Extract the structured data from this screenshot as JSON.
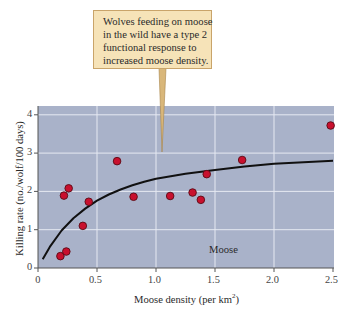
{
  "callout": {
    "lines": [
      "Wolves feeding on moose",
      "in the wild have a type 2",
      "functional response to",
      "increased moose density."
    ]
  },
  "axes": {
    "ylabel": "Killing rate (no./wolf/100 days)",
    "xlabel": "Moose density (per km",
    "xlabel_sup": "2",
    "xlabel_end": ")",
    "xticks": [
      "0",
      "0.5",
      "1.0",
      "1.5",
      "2.0",
      "2.5"
    ],
    "yticks": [
      "0",
      "1",
      "2",
      "3",
      "4"
    ]
  },
  "series_label": "Moose",
  "colors": {
    "plot_bg": "#a9b2c9",
    "grid": "#e6e9f2",
    "point_fill": "#c8102e",
    "point_edge": "#5a0a14",
    "curve": "#111111",
    "callout_bg": "#f6e3b8",
    "callout_border": "#c9a46a"
  },
  "chart_data": {
    "type": "scatter",
    "title": "",
    "xlabel": "Moose density (per km²)",
    "ylabel": "Killing rate (no./wolf/100 days)",
    "xlim": [
      0,
      2.5
    ],
    "ylim": [
      0,
      4.2
    ],
    "xticks": [
      0,
      0.5,
      1.0,
      1.5,
      2.0,
      2.5
    ],
    "yticks": [
      0,
      1,
      2,
      3,
      4
    ],
    "grid": true,
    "annotation": "Wolves feeding on moose in the wild have a type 2 functional response to increased moose density.",
    "series": [
      {
        "name": "Moose",
        "type": "scatter",
        "points": [
          {
            "x": 0.19,
            "y": 0.31
          },
          {
            "x": 0.24,
            "y": 0.43
          },
          {
            "x": 0.22,
            "y": 1.89
          },
          {
            "x": 0.26,
            "y": 2.08
          },
          {
            "x": 0.38,
            "y": 1.1
          },
          {
            "x": 0.43,
            "y": 1.73
          },
          {
            "x": 0.67,
            "y": 2.79
          },
          {
            "x": 0.81,
            "y": 1.86
          },
          {
            "x": 1.12,
            "y": 1.88
          },
          {
            "x": 1.31,
            "y": 1.97
          },
          {
            "x": 1.38,
            "y": 1.78
          },
          {
            "x": 1.43,
            "y": 2.45
          },
          {
            "x": 1.73,
            "y": 2.82
          },
          {
            "x": 2.48,
            "y": 3.72
          }
        ]
      },
      {
        "name": "Type 2 functional response fit",
        "type": "line",
        "points": [
          {
            "x": 0.04,
            "y": 0.23
          },
          {
            "x": 0.1,
            "y": 0.55
          },
          {
            "x": 0.2,
            "y": 0.98
          },
          {
            "x": 0.3,
            "y": 1.3
          },
          {
            "x": 0.4,
            "y": 1.55
          },
          {
            "x": 0.5,
            "y": 1.76
          },
          {
            "x": 0.6,
            "y": 1.92
          },
          {
            "x": 0.7,
            "y": 2.05
          },
          {
            "x": 0.8,
            "y": 2.16
          },
          {
            "x": 0.9,
            "y": 2.25
          },
          {
            "x": 1.0,
            "y": 2.33
          },
          {
            "x": 1.25,
            "y": 2.46
          },
          {
            "x": 1.5,
            "y": 2.56
          },
          {
            "x": 1.75,
            "y": 2.65
          },
          {
            "x": 2.0,
            "y": 2.72
          },
          {
            "x": 2.25,
            "y": 2.76
          },
          {
            "x": 2.5,
            "y": 2.8
          }
        ]
      }
    ]
  }
}
